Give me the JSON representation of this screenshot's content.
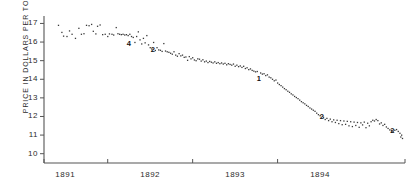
{
  "chart_data": {
    "type": "scatter",
    "title": "",
    "xlabel": "",
    "ylabel": "PRICE IN DOLLARS PER TON",
    "ylim": [
      9.5,
      17.4
    ],
    "yticks": [
      17,
      16,
      15,
      14,
      13,
      12,
      11,
      10
    ],
    "ytick_labels": [
      "17",
      "16",
      "15",
      "14",
      "13",
      "12",
      "11",
      "10"
    ],
    "xlim": [
      1890.75,
      1895.0
    ],
    "xticks": [
      1891,
      1892,
      1893,
      1894
    ],
    "xtick_labels": [
      "1891",
      "1892",
      "1893",
      "1894"
    ],
    "grid": false,
    "legend": null,
    "point_labels": [
      {
        "text": "4",
        "x": 1891.75,
        "y": 15.95
      },
      {
        "text": "2",
        "x": 1892.03,
        "y": 15.6
      },
      {
        "text": "1",
        "x": 1893.28,
        "y": 14.05
      },
      {
        "text": "2",
        "x": 1894.02,
        "y": 12.0
      },
      {
        "text": "2",
        "x": 1894.85,
        "y": 11.3
      }
    ],
    "points": [
      [
        1890.92,
        16.9
      ],
      [
        1890.96,
        16.52
      ],
      [
        1890.98,
        16.32
      ],
      [
        1891.02,
        16.3
      ],
      [
        1891.05,
        16.6
      ],
      [
        1891.08,
        16.42
      ],
      [
        1891.12,
        16.2
      ],
      [
        1891.16,
        16.74
      ],
      [
        1891.19,
        16.42
      ],
      [
        1891.22,
        16.45
      ],
      [
        1891.25,
        16.9
      ],
      [
        1891.28,
        16.88
      ],
      [
        1891.31,
        16.95
      ],
      [
        1891.33,
        16.58
      ],
      [
        1891.36,
        16.44
      ],
      [
        1891.38,
        16.85
      ],
      [
        1891.41,
        16.92
      ],
      [
        1891.44,
        16.4
      ],
      [
        1891.47,
        16.42
      ],
      [
        1891.5,
        16.3
      ],
      [
        1891.52,
        16.44
      ],
      [
        1891.55,
        16.42
      ],
      [
        1891.57,
        16.38
      ],
      [
        1891.6,
        16.78
      ],
      [
        1891.62,
        16.45
      ],
      [
        1891.64,
        16.42
      ],
      [
        1891.66,
        16.4
      ],
      [
        1891.68,
        16.42
      ],
      [
        1891.7,
        16.38
      ],
      [
        1891.72,
        16.4
      ],
      [
        1891.74,
        16.35
      ],
      [
        1891.76,
        16.42
      ],
      [
        1891.78,
        16.3
      ],
      [
        1891.8,
        16.25
      ],
      [
        1891.82,
        15.98
      ],
      [
        1891.84,
        16.3
      ],
      [
        1891.86,
        16.55
      ],
      [
        1891.88,
        16.12
      ],
      [
        1891.9,
        15.9
      ],
      [
        1891.92,
        16.2
      ],
      [
        1891.94,
        15.96
      ],
      [
        1891.96,
        16.35
      ],
      [
        1891.98,
        15.85
      ],
      [
        1892.0,
        15.7
      ],
      [
        1892.02,
        15.62
      ],
      [
        1892.04,
        15.98
      ],
      [
        1892.06,
        15.55
      ],
      [
        1892.08,
        15.7
      ],
      [
        1892.1,
        15.58
      ],
      [
        1892.12,
        15.56
      ],
      [
        1892.14,
        15.5
      ],
      [
        1892.16,
        15.92
      ],
      [
        1892.18,
        15.52
      ],
      [
        1892.2,
        15.48
      ],
      [
        1892.22,
        15.45
      ],
      [
        1892.24,
        15.4
      ],
      [
        1892.26,
        15.35
      ],
      [
        1892.28,
        15.48
      ],
      [
        1892.3,
        15.3
      ],
      [
        1892.32,
        15.24
      ],
      [
        1892.34,
        15.38
      ],
      [
        1892.36,
        15.26
      ],
      [
        1892.38,
        15.3
      ],
      [
        1892.4,
        15.18
      ],
      [
        1892.42,
        15.2
      ],
      [
        1892.44,
        15.02
      ],
      [
        1892.46,
        15.22
      ],
      [
        1892.48,
        15.1
      ],
      [
        1892.5,
        15.16
      ],
      [
        1892.52,
        15.04
      ],
      [
        1892.54,
        15.0
      ],
      [
        1892.56,
        15.1
      ],
      [
        1892.58,
        15.08
      ],
      [
        1892.6,
        14.98
      ],
      [
        1892.62,
        15.05
      ],
      [
        1892.64,
        14.94
      ],
      [
        1892.66,
        14.98
      ],
      [
        1892.68,
        14.9
      ],
      [
        1892.7,
        14.96
      ],
      [
        1892.72,
        14.92
      ],
      [
        1892.74,
        14.88
      ],
      [
        1892.76,
        14.94
      ],
      [
        1892.78,
        14.86
      ],
      [
        1892.8,
        14.9
      ],
      [
        1892.82,
        14.84
      ],
      [
        1892.84,
        14.88
      ],
      [
        1892.86,
        14.82
      ],
      [
        1892.88,
        14.86
      ],
      [
        1892.9,
        14.78
      ],
      [
        1892.92,
        14.84
      ],
      [
        1892.94,
        14.8
      ],
      [
        1892.96,
        14.76
      ],
      [
        1892.98,
        14.82
      ],
      [
        1893.0,
        14.7
      ],
      [
        1893.02,
        14.76
      ],
      [
        1893.04,
        14.68
      ],
      [
        1893.06,
        14.72
      ],
      [
        1893.08,
        14.64
      ],
      [
        1893.1,
        14.7
      ],
      [
        1893.12,
        14.58
      ],
      [
        1893.14,
        14.62
      ],
      [
        1893.16,
        14.52
      ],
      [
        1893.18,
        14.56
      ],
      [
        1893.2,
        14.48
      ],
      [
        1893.22,
        14.44
      ],
      [
        1893.24,
        14.4
      ],
      [
        1893.26,
        14.42
      ],
      [
        1893.3,
        14.34
      ],
      [
        1893.32,
        14.28
      ],
      [
        1893.34,
        14.3
      ],
      [
        1893.36,
        14.2
      ],
      [
        1893.38,
        14.24
      ],
      [
        1893.4,
        14.12
      ],
      [
        1893.42,
        14.08
      ],
      [
        1893.44,
        14.0
      ],
      [
        1893.46,
        13.92
      ],
      [
        1893.48,
        13.96
      ],
      [
        1893.5,
        13.8
      ],
      [
        1893.52,
        13.72
      ],
      [
        1893.54,
        13.66
      ],
      [
        1893.56,
        13.58
      ],
      [
        1893.58,
        13.5
      ],
      [
        1893.6,
        13.44
      ],
      [
        1893.62,
        13.36
      ],
      [
        1893.64,
        13.3
      ],
      [
        1893.66,
        13.22
      ],
      [
        1893.68,
        13.16
      ],
      [
        1893.7,
        13.08
      ],
      [
        1893.72,
        13.02
      ],
      [
        1893.74,
        12.96
      ],
      [
        1893.76,
        12.88
      ],
      [
        1893.78,
        12.8
      ],
      [
        1893.8,
        12.74
      ],
      [
        1893.82,
        12.68
      ],
      [
        1893.84,
        12.6
      ],
      [
        1893.86,
        12.54
      ],
      [
        1893.88,
        12.46
      ],
      [
        1893.9,
        12.4
      ],
      [
        1893.92,
        12.34
      ],
      [
        1893.94,
        12.28
      ],
      [
        1893.96,
        12.18
      ],
      [
        1893.98,
        12.1
      ],
      [
        1894.0,
        12.04
      ],
      [
        1894.04,
        11.96
      ],
      [
        1894.06,
        11.84
      ],
      [
        1894.08,
        11.9
      ],
      [
        1894.1,
        11.78
      ],
      [
        1894.12,
        11.86
      ],
      [
        1894.14,
        11.72
      ],
      [
        1894.16,
        11.82
      ],
      [
        1894.18,
        11.68
      ],
      [
        1894.2,
        11.8
      ],
      [
        1894.22,
        11.62
      ],
      [
        1894.24,
        11.78
      ],
      [
        1894.26,
        11.56
      ],
      [
        1894.28,
        11.76
      ],
      [
        1894.3,
        11.58
      ],
      [
        1894.32,
        11.74
      ],
      [
        1894.34,
        11.5
      ],
      [
        1894.36,
        11.72
      ],
      [
        1894.38,
        11.46
      ],
      [
        1894.4,
        11.7
      ],
      [
        1894.42,
        11.52
      ],
      [
        1894.44,
        11.68
      ],
      [
        1894.46,
        11.42
      ],
      [
        1894.48,
        11.66
      ],
      [
        1894.5,
        11.55
      ],
      [
        1894.52,
        11.7
      ],
      [
        1894.54,
        11.4
      ],
      [
        1894.56,
        11.64
      ],
      [
        1894.58,
        11.5
      ],
      [
        1894.6,
        11.72
      ],
      [
        1894.62,
        11.8
      ],
      [
        1894.64,
        11.76
      ],
      [
        1894.66,
        11.84
      ],
      [
        1894.68,
        11.78
      ],
      [
        1894.7,
        11.6
      ],
      [
        1894.72,
        11.66
      ],
      [
        1894.74,
        11.52
      ],
      [
        1894.76,
        11.58
      ],
      [
        1894.78,
        11.44
      ],
      [
        1894.8,
        11.36
      ],
      [
        1894.82,
        11.28
      ],
      [
        1894.84,
        11.24
      ],
      [
        1894.86,
        11.18
      ],
      [
        1894.88,
        11.26
      ],
      [
        1894.9,
        11.3
      ],
      [
        1894.92,
        11.2
      ],
      [
        1894.94,
        11.1
      ],
      [
        1894.95,
        10.9
      ],
      [
        1894.96,
        11.0
      ],
      [
        1894.97,
        10.82
      ]
    ]
  }
}
